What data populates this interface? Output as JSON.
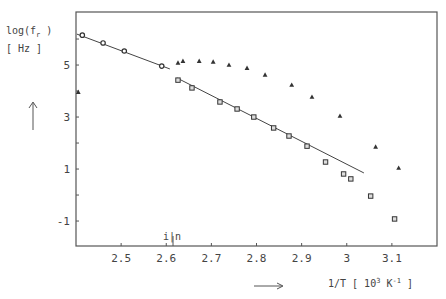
{
  "chart_data": {
    "type": "scatter",
    "title": "",
    "xlabel": "1/T [ 10^3 K^-1 ]",
    "ylabel": "log(f_r) [ Hz ]",
    "xlim": [
      2.4,
      3.2
    ],
    "ylim": [
      -1.96,
      7.04
    ],
    "x_ticks": [
      2.5,
      2.6,
      2.7,
      2.8,
      2.9,
      3,
      3.1
    ],
    "x_tick_labels": [
      "2.5",
      "2.6",
      "2.7",
      "2.8",
      "2.9",
      "3",
      "3.1"
    ],
    "y_ticks": [
      -1,
      0,
      1,
      2,
      3,
      4,
      5,
      6
    ],
    "y_tick_labels": [
      "-1",
      "",
      "1",
      "",
      "3",
      "",
      "5",
      ""
    ],
    "grid": false,
    "legend": null,
    "annotations": [
      {
        "text": "i|n",
        "x": 2.615,
        "y": -1.6
      }
    ],
    "series": [
      {
        "name": "circles",
        "marker": "circle",
        "x": [
          2.414,
          2.46,
          2.507,
          2.59
        ],
        "y": [
          6.15,
          5.85,
          5.54,
          4.96
        ]
      },
      {
        "name": "squares",
        "marker": "square",
        "x": [
          2.626,
          2.657,
          2.719,
          2.757,
          2.794,
          2.838,
          2.872,
          2.912,
          2.953,
          2.993,
          3.009,
          3.053,
          3.106
        ],
        "y": [
          4.42,
          4.12,
          3.58,
          3.31,
          3.0,
          2.58,
          2.27,
          1.88,
          1.27,
          0.81,
          0.62,
          -0.04,
          -0.92
        ]
      },
      {
        "name": "triangles",
        "marker": "triangle",
        "x": [
          2.405,
          2.626,
          2.637,
          2.673,
          2.704,
          2.739,
          2.779,
          2.819,
          2.878,
          2.923,
          2.985,
          3.064,
          3.115
        ],
        "y": [
          3.96,
          5.08,
          5.15,
          5.15,
          5.12,
          5.0,
          4.88,
          4.62,
          4.23,
          3.77,
          3.04,
          1.85,
          1.04
        ]
      }
    ],
    "fit_lines": [
      {
        "name": "fit-high-T",
        "x": [
          2.402,
          2.608
        ],
        "y": [
          6.19,
          4.85
        ]
      },
      {
        "name": "fit-low-T",
        "x": [
          2.624,
          3.038
        ],
        "y": [
          4.5,
          0.85
        ]
      }
    ]
  },
  "labels": {
    "ylabel_line1": "log(f",
    "ylabel_sub": "r",
    "ylabel_line1_end": " )",
    "ylabel_line2": "[ Hz ]",
    "xlabel_pre": "1/T [ 10",
    "xlabel_sup1": "3",
    "xlabel_mid": " K",
    "xlabel_sup2": "-1",
    "xlabel_end": " ]",
    "annotation": "i|n"
  },
  "colors": {
    "axis": "#555555",
    "marker": "#333333",
    "line": "#444444",
    "text": "#444444"
  }
}
